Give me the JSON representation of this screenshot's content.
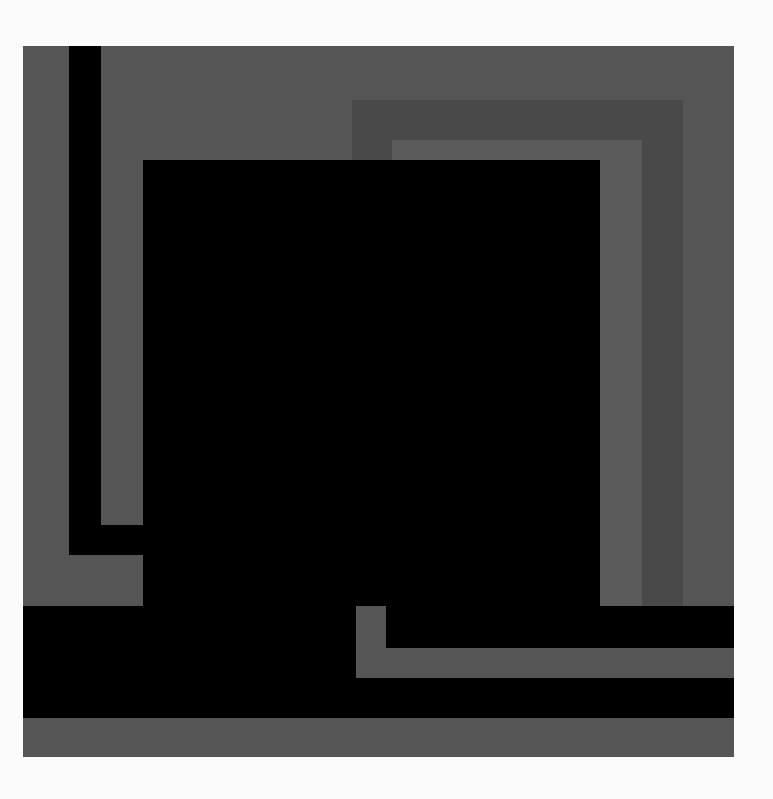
{
  "artwork": {
    "description": "Abstract geometric composition of nested gray and black rectangles",
    "colors": {
      "background": "#fbfbfb",
      "outer_gray": "#555555",
      "dark_band": "#494949",
      "light_band": "#5a5a5a",
      "black": "#000000"
    },
    "shapes": [
      {
        "name": "outer-panel",
        "x": 23,
        "y": 46,
        "w": 711,
        "h": 711,
        "color": "#555555"
      },
      {
        "name": "left-black-vertical-bar",
        "x": 69,
        "y": 46,
        "w": 32,
        "h": 509,
        "color": "#000000"
      },
      {
        "name": "left-black-horizontal-bar",
        "x": 69,
        "y": 525,
        "w": 74,
        "h": 30,
        "color": "#000000"
      },
      {
        "name": "dark-gray-inner-frame",
        "x": 352,
        "y": 100,
        "w": 331,
        "h": 506,
        "color": "#494949"
      },
      {
        "name": "light-gray-inner-frame",
        "x": 392,
        "y": 140,
        "w": 250,
        "h": 466,
        "color": "#5a5a5a"
      },
      {
        "name": "central-black-square",
        "x": 143,
        "y": 160,
        "w": 457,
        "h": 446,
        "color": "#000000"
      },
      {
        "name": "bottom-black-band",
        "x": 23,
        "y": 606,
        "w": 711,
        "h": 112,
        "color": "#000000"
      },
      {
        "name": "gray-l-vertical",
        "x": 356,
        "y": 606,
        "w": 30,
        "h": 72,
        "color": "#555555"
      },
      {
        "name": "gray-l-horizontal",
        "x": 356,
        "y": 648,
        "w": 378,
        "h": 30,
        "color": "#555555"
      }
    ]
  }
}
